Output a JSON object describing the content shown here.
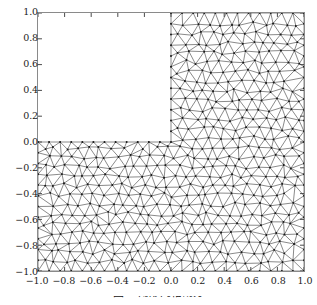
{
  "figure": {
    "kind": "triangular-mesh-plot",
    "background_color": "#ffffff",
    "frame_color": "#8a8a8a"
  },
  "chart_data": {
    "type": "scatter",
    "title": "",
    "subtitle": "",
    "xlabel": "",
    "ylabel": "",
    "xlim": [
      -1.0,
      1.0
    ],
    "ylim": [
      -1.0,
      1.0
    ],
    "grid": false,
    "legend": null,
    "legend_position": "none",
    "annotations": [],
    "domain": {
      "shape": "L-shape",
      "outer_square": [
        [
          -1.0,
          -1.0
        ],
        [
          1.0,
          1.0
        ]
      ],
      "removed_quadrant": [
        [
          -1.0,
          0.0
        ],
        [
          0.0,
          1.0
        ]
      ],
      "reentrant_corner": [
        0.0,
        0.0
      ],
      "boundary_polygon": [
        [
          -1.0,
          -1.0
        ],
        [
          1.0,
          -1.0
        ],
        [
          1.0,
          1.0
        ],
        [
          0.0,
          1.0
        ],
        [
          0.0,
          0.0
        ],
        [
          -1.0,
          0.0
        ]
      ]
    },
    "mesh": {
      "element_type": "triangle",
      "node_marker": "dot",
      "node_color": "#1a1a1a",
      "edge_color": "#3a3a3a",
      "edge_width": 0.6,
      "target_edge_length": 0.085,
      "uniform_density": true
    },
    "xticks": [
      -1.0,
      -0.8,
      -0.6,
      -0.4,
      -0.2,
      0.0,
      0.2,
      0.4,
      0.6,
      0.8,
      1.0
    ],
    "yticks": [
      -1.0,
      -0.8,
      -0.6,
      -0.4,
      -0.2,
      0.0,
      0.2,
      0.4,
      0.6,
      0.8,
      1.0
    ],
    "xticklabels": [
      "−1.0",
      "−0.8",
      "−0.6",
      "−0.4",
      "−0.2",
      "0.0",
      "0.2",
      "0.4",
      "0.6",
      "0.8",
      "1.0"
    ],
    "yticklabels": [
      "−1.0",
      "−0.8",
      "−0.6",
      "−0.4",
      "−0.2",
      "0.0",
      "0.2",
      "0.4",
      "0.6",
      "0.8",
      "1.0"
    ],
    "tick_direction": "in"
  },
  "caption": {
    "text": "图  三角形网格剖分",
    "note_visible": "clipped at image bottom edge"
  }
}
